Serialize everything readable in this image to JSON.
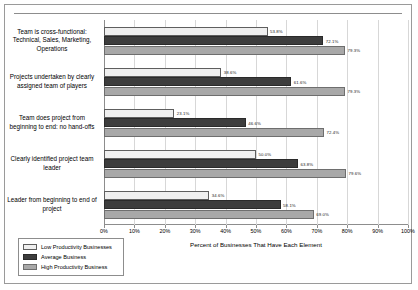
{
  "chart_data": {
    "type": "bar",
    "orientation": "horizontal",
    "title": "",
    "xlabel": "Percent of Businesses That Have Each Element",
    "ylabel": "",
    "xlim": [
      0,
      100
    ],
    "grid": true,
    "legend_position": "bottom-left",
    "xticks": [
      "0%",
      "10%",
      "20%",
      "30%",
      "40%",
      "50%",
      "60%",
      "70%",
      "80%",
      "90%",
      "100%"
    ],
    "xtick_values": [
      0,
      10,
      20,
      30,
      40,
      50,
      60,
      70,
      80,
      90,
      100
    ],
    "categories": [
      "Team is cross-functional: Technical, Sales, Marketing, Operations",
      "Projects undertaken by clearly assigned team of players",
      "Team does project from beginning to end: no hand-offs",
      "Clearly identified project team leader",
      "Leader from beginning to end of project"
    ],
    "series": [
      {
        "name": "Low Productivity Businesses",
        "color": "#efefef",
        "values": [
          53.8,
          38.6,
          23.1,
          50.0,
          34.6
        ],
        "labels": [
          "53.8%",
          "38.6%",
          "23.1%",
          "50.0%",
          "34.6%"
        ]
      },
      {
        "name": "Average Business",
        "color": "#3d3d3d",
        "values": [
          72.1,
          61.6,
          46.6,
          63.8,
          58.1
        ],
        "labels": [
          "72.1%",
          "61.6%",
          "46.6%",
          "63.8%",
          "58.1%"
        ]
      },
      {
        "name": "High Productivity Business",
        "color": "#a8a8a8",
        "values": [
          79.3,
          79.3,
          72.4,
          79.6,
          69.0
        ],
        "labels": [
          "79.3%",
          "79.3%",
          "72.4%",
          "79.6%",
          "69.0%"
        ]
      }
    ]
  }
}
